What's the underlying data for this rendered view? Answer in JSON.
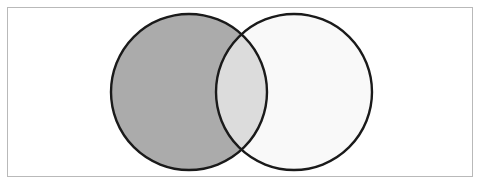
{
  "figure": {
    "width": 481,
    "height": 185,
    "background_color": "#ffffff"
  },
  "frame": {
    "name": "image-border",
    "x": 7,
    "y": 7,
    "width": 466,
    "height": 170,
    "stroke_color": "#b9b9b9",
    "stroke_width": 1,
    "fill_color": "#ffffff"
  },
  "chart_data": {
    "type": "venn",
    "xlabel": "",
    "ylabel": "",
    "grid": false,
    "legend": "none",
    "sets": [
      {
        "name": "left-circle",
        "label": "",
        "cx": 189,
        "cy": 92,
        "r": 78,
        "fill": "#ababab",
        "fill_opacity": 1,
        "stroke": "#1a1a1a",
        "stroke_width": 2.4
      },
      {
        "name": "right-circle",
        "label": "",
        "cx": 294,
        "cy": 92,
        "r": 78,
        "fill": "#f7f7f7",
        "fill_opacity": 0.78,
        "stroke": "#1a1a1a",
        "stroke_width": 2.4
      }
    ],
    "regions": [
      {
        "name": "left-only",
        "fill": "#ababab"
      },
      {
        "name": "intersection",
        "fill": "#dcdcdc"
      },
      {
        "name": "right-only",
        "fill": "#f7f7f7"
      }
    ],
    "intersection_points": [
      {
        "x": 240,
        "y": 27
      },
      {
        "x": 240,
        "y": 157
      }
    ],
    "annotations": []
  }
}
